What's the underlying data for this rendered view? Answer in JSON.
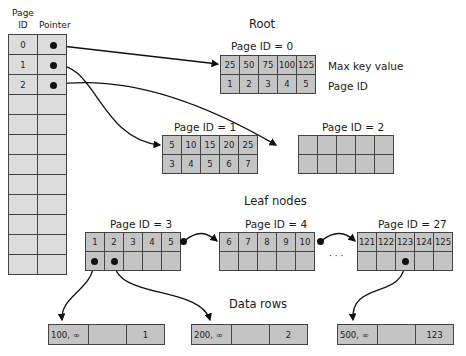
{
  "header": {
    "page_id_label_line1": "Page",
    "page_id_label_line2": "ID",
    "pointer_label": "Pointer"
  },
  "page_table": {
    "rows": [
      {
        "id": "0",
        "pointer": "dot"
      },
      {
        "id": "1",
        "pointer": "dot"
      },
      {
        "id": "2",
        "pointer": "dot"
      },
      {
        "id": "",
        "pointer": ""
      },
      {
        "id": "",
        "pointer": ""
      },
      {
        "id": "",
        "pointer": ""
      },
      {
        "id": "",
        "pointer": ""
      },
      {
        "id": "",
        "pointer": ""
      },
      {
        "id": "",
        "pointer": ""
      },
      {
        "id": "",
        "pointer": ""
      },
      {
        "id": "",
        "pointer": ""
      },
      {
        "id": "",
        "pointer": ""
      }
    ]
  },
  "root": {
    "heading": "Root",
    "page_label": "Page ID = 0",
    "keys": [
      "25",
      "50",
      "75",
      "100",
      "125"
    ],
    "page_ids": [
      "1",
      "2",
      "3",
      "4",
      "5"
    ],
    "key_row_label": "Max key value",
    "page_row_label": "Page ID"
  },
  "intermediate": [
    {
      "page_label": "Page ID = 1",
      "keys": [
        "5",
        "10",
        "15",
        "20",
        "25"
      ],
      "page_ids": [
        "3",
        "4",
        "5",
        "6",
        "7"
      ]
    },
    {
      "page_label": "Page ID = 2",
      "keys": [
        "",
        "",
        "",
        "",
        ""
      ],
      "page_ids": [
        "",
        "",
        "",
        "",
        ""
      ]
    }
  ],
  "leaf": {
    "heading": "Leaf nodes",
    "nodes": [
      {
        "page_label": "Page ID = 3",
        "keys": [
          "1",
          "2",
          "3",
          "4",
          "5"
        ]
      },
      {
        "page_label": "Page ID = 4",
        "keys": [
          "6",
          "7",
          "8",
          "9",
          "10"
        ]
      },
      {
        "page_label": "Page ID = 27",
        "keys": [
          "121",
          "122",
          "123",
          "124",
          "125"
        ]
      }
    ],
    "ellipsis": "· · ·"
  },
  "data_rows": {
    "heading": "Data rows",
    "rows": [
      {
        "c1": "100, ∞",
        "c2": "",
        "c3": "1"
      },
      {
        "c1": "200, ∞",
        "c2": "",
        "c3": "2"
      },
      {
        "c1": "500, ∞",
        "c2": "",
        "c3": "123"
      }
    ]
  },
  "colors": {
    "cell_dark": "#c4c4c4",
    "cell_light": "#dcdcdc",
    "border": "#444444",
    "line": "#111111"
  }
}
